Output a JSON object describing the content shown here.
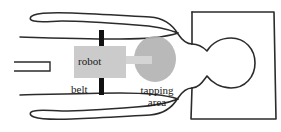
{
  "figure": {
    "labels": {
      "robot": "robot",
      "belt": "belt",
      "tapping_line1": "tapping",
      "tapping_line2": "area"
    },
    "colors": {
      "outline": "#2b2b2b",
      "robot_fill": "#c9c9c9",
      "belt_fill": "#111111",
      "tapping_fill": "#b0b0b0",
      "arm_fill": "#d6d6d6",
      "background": "#ffffff",
      "text": "#1a1a1a"
    },
    "parts": [
      {
        "name": "torso-rectangle",
        "shape": "rectangle"
      },
      {
        "name": "head-circle",
        "shape": "circle"
      },
      {
        "name": "upper-arm-outline",
        "shape": "path"
      },
      {
        "name": "lower-arm-outline",
        "shape": "path"
      },
      {
        "name": "table-edge-bracket",
        "shape": "open-rectangle"
      },
      {
        "name": "robot-box",
        "shape": "rectangle"
      },
      {
        "name": "belt-bar-top",
        "shape": "bar"
      },
      {
        "name": "belt-bar-bottom",
        "shape": "bar"
      },
      {
        "name": "robot-arm-connector",
        "shape": "bar"
      },
      {
        "name": "tapping-area-ellipse",
        "shape": "ellipse"
      }
    ]
  }
}
